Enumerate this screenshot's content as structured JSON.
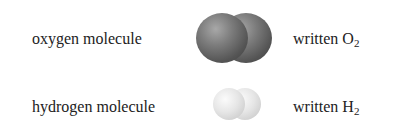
{
  "rows": [
    {
      "name": "oxygen molecule",
      "written_prefix": "written ",
      "symbol": "O",
      "subscript": "2",
      "atom_color": "#6e6e6e"
    },
    {
      "name": "hydrogen molecule",
      "written_prefix": "written ",
      "symbol": "H",
      "subscript": "2",
      "atom_color": "#e2e2e2"
    }
  ]
}
